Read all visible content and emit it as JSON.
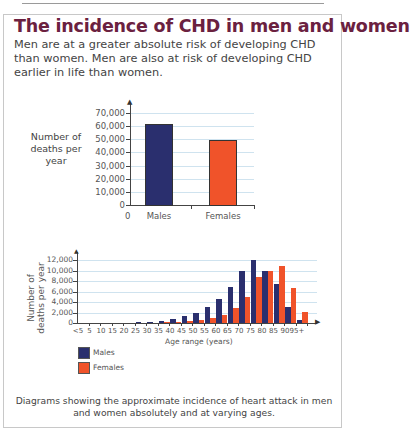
{
  "header": {
    "title": "The incidence of CHD in men and women",
    "intro": "Men are at a greater absolute risk of developing CHD than women. Men are also at risk of developing CHD earlier in life than women."
  },
  "colors": {
    "males": "#2a2f6e",
    "females": "#f0532a",
    "title": "#6b2140",
    "grid": "#cfe3ef"
  },
  "caption": "Diagrams showing the approximate incidence of heart attack in men and women absolutely and at varying ages.",
  "chart_data": [
    {
      "type": "bar",
      "title": "",
      "ylabel": "Number of deaths per year",
      "xlabel": "",
      "categories": [
        "Males",
        "Females"
      ],
      "values": [
        60500,
        48500
      ],
      "ylim": [
        0,
        70000
      ],
      "yticks": [
        "0",
        "10,000",
        "20,000",
        "30,000",
        "40,000",
        "50,000",
        "60,000",
        "70,000"
      ],
      "x_origin_label": "0",
      "grid": true
    },
    {
      "type": "bar",
      "title": "",
      "ylabel": "Number of deaths per year",
      "xlabel": "Age range (years)",
      "categories": [
        "<5",
        "5",
        "10",
        "15",
        "20",
        "25",
        "30",
        "35",
        "40",
        "45",
        "50",
        "55",
        "60",
        "65",
        "70",
        "75",
        "80",
        "85",
        "90",
        "95+"
      ],
      "series": [
        {
          "name": "Males",
          "values": [
            0,
            0,
            0,
            0,
            0,
            50,
            100,
            300,
            700,
            1300,
            2000,
            3000,
            4500,
            6800,
            10000,
            12000,
            10000,
            7500,
            3000,
            500
          ]
        },
        {
          "name": "Females",
          "values": [
            0,
            0,
            0,
            0,
            0,
            0,
            0,
            50,
            150,
            300,
            500,
            900,
            1600,
            2800,
            5000,
            8700,
            10000,
            10800,
            6700,
            2100
          ]
        }
      ],
      "ylim": [
        0,
        12000
      ],
      "yticks": [
        "0",
        "2,000",
        "4,000",
        "6,000",
        "8,000",
        "10,000",
        "12,000"
      ],
      "legend": [
        "Males",
        "Females"
      ],
      "legend_position": "bottom-left",
      "grid": true
    }
  ]
}
